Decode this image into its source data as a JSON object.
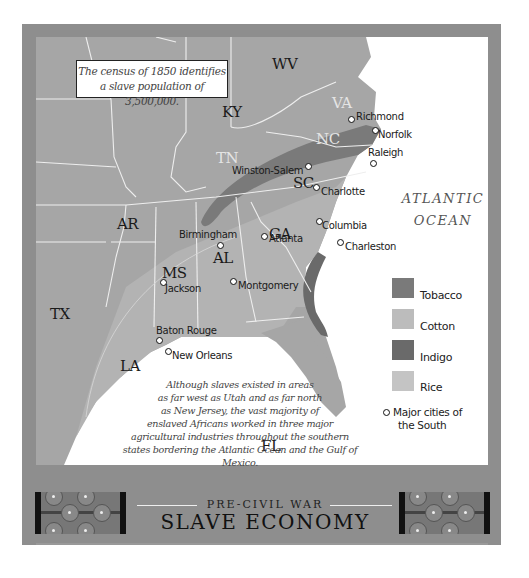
{
  "census_box": {
    "line1": "The census of 1850 identifies",
    "line2": "a slave population of 3,500,000."
  },
  "states": {
    "KY": "KY",
    "WV": "WV",
    "VA": "VA",
    "NC": "NC",
    "TN": "TN",
    "SC": "SC",
    "GA": "GA",
    "AL": "AL",
    "MS": "MS",
    "AR": "AR",
    "LA": "LA",
    "TX": "TX",
    "FL": "FL"
  },
  "cities": [
    {
      "name": "Richmond"
    },
    {
      "name": "Norfolk"
    },
    {
      "name": "Raleigh"
    },
    {
      "name": "Winston-Salem"
    },
    {
      "name": "Charlotte"
    },
    {
      "name": "Columbia"
    },
    {
      "name": "Charleston"
    },
    {
      "name": "Atlanta"
    },
    {
      "name": "Birmingham"
    },
    {
      "name": "Montgomery"
    },
    {
      "name": "Jackson"
    },
    {
      "name": "Baton Rouge"
    },
    {
      "name": "New Orleans"
    }
  ],
  "ocean_label": {
    "line1": "ATLANTIC",
    "line2": "OCEAN"
  },
  "legend": {
    "items": [
      {
        "label": "Tobacco",
        "color": "#7a7a7a"
      },
      {
        "label": "Cotton",
        "color": "#bcbcbc"
      },
      {
        "label": "Indigo",
        "color": "#6a6a6a"
      },
      {
        "label": "Rice",
        "color": "#c4c4c4"
      }
    ],
    "cities_note_line1": "Major cities of",
    "cities_note_line2": "the South"
  },
  "blurb": {
    "lines": [
      "Although slaves existed in areas",
      "as far west as Utah and as far north",
      "as New Jersey, the vast majority of",
      "enslaved Africans worked in three major",
      "agricultural industries throughout the southern",
      "states bordering the Atlantic Ocean and the Gulf of Mexico."
    ]
  },
  "title": {
    "kicker": "PRE-CIVIL WAR",
    "main": "SLAVE ECONOMY"
  },
  "colors": {
    "frame": "#8e8e8e",
    "land": "#a6a6a6",
    "cotton_land": "#bcbcbc",
    "tobacco_band": "#7a7a7a",
    "indigo_band": "#6a6a6a",
    "water": "#ffffff",
    "borders": "#eeeeee"
  }
}
